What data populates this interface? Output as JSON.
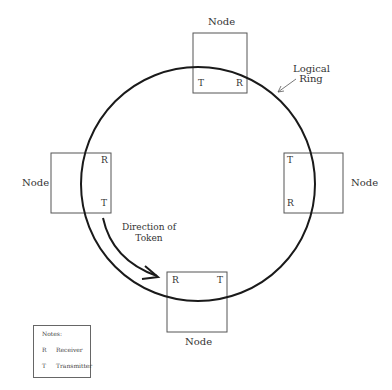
{
  "diagram": {
    "ring_label_line1": "Logical",
    "ring_label_line2": "Ring",
    "direction_line1": "Direction of",
    "direction_line2": "Token",
    "nodes": [
      {
        "position": "top",
        "label": "Node",
        "port_left": "T",
        "port_right": "R"
      },
      {
        "position": "left",
        "label": "Node",
        "port_top": "R",
        "port_bottom": "T"
      },
      {
        "position": "right",
        "label": "Node",
        "port_top": "T",
        "port_bottom": "R"
      },
      {
        "position": "bottom",
        "label": "Node",
        "port_left": "R",
        "port_right": "T"
      }
    ],
    "notes": {
      "title": "Notes:",
      "items": [
        {
          "key": "R",
          "value": "Receiver"
        },
        {
          "key": "T",
          "value": "Transmitter"
        }
      ]
    },
    "colors": {
      "line": "#222222",
      "box": "#555555",
      "text": "#333333"
    }
  }
}
